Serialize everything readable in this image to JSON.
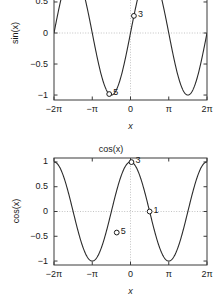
{
  "chart_data": [
    {
      "type": "line",
      "title": "",
      "title_visible": false,
      "xlabel": "x",
      "ylabel": "sin(x)",
      "xlim": [
        -6.283185307179586,
        6.283185307179586
      ],
      "ylim": [
        -1.08,
        1.08
      ],
      "y_view_clipped_top": true,
      "grid": false,
      "zero_gridlines": true,
      "legend": "none",
      "xticks": [
        -6.283185307179586,
        -3.141592653589793,
        0,
        3.141592653589793,
        6.283185307179586
      ],
      "xticklabels": [
        "−2π",
        "−π",
        "0",
        "π",
        "2π"
      ],
      "yticks": [
        1,
        0.5,
        0,
        -0.5,
        -1
      ],
      "yticklabels": [
        "1",
        "0.5",
        "0",
        "−0.5",
        "−1"
      ],
      "visible_yticklabels": [
        "0.5",
        "0",
        "−0.5",
        "−1"
      ],
      "series": [
        {
          "name": "sin(x)",
          "color": "#2b2b2b",
          "linewidth": 1.1,
          "x_start": -6.283185307179586,
          "x_end": 6.283185307179586,
          "samples": 400,
          "fn": "sin"
        }
      ],
      "markers": [
        {
          "label": "3",
          "x": 0.28,
          "y": 0.276
        },
        {
          "label": "5",
          "x": -1.75,
          "y": -0.984
        }
      ]
    },
    {
      "type": "line",
      "title": "cos(x)",
      "title_visible": true,
      "xlabel": "x",
      "ylabel": "cos(x)",
      "xlim": [
        -6.283185307179586,
        6.283185307179586
      ],
      "ylim": [
        -1.08,
        1.08
      ],
      "y_view_clipped_top": false,
      "grid": false,
      "zero_gridlines": true,
      "legend": "none",
      "xticks": [
        -6.283185307179586,
        -3.141592653589793,
        0,
        3.141592653589793,
        6.283185307179586
      ],
      "xticklabels": [
        "−2π",
        "−π",
        "0",
        "π",
        "2π"
      ],
      "yticks": [
        1,
        0.5,
        0,
        -0.5,
        -1
      ],
      "yticklabels": [
        "1",
        "0.5",
        "0",
        "−0.5",
        "−1"
      ],
      "visible_yticklabels": [
        "1",
        "0.5",
        "0",
        "−0.5",
        "−1"
      ],
      "series": [
        {
          "name": "cos(x)",
          "color": "#2b2b2b",
          "linewidth": 1.1,
          "x_start": -6.283185307179586,
          "x_end": 6.283185307179586,
          "samples": 400,
          "fn": "cos"
        }
      ],
      "markers": [
        {
          "label": "3",
          "x": 0.08,
          "y": 0.997
        },
        {
          "label": "1",
          "x": 1.57,
          "y": 0.0
        },
        {
          "label": "5",
          "x": -1.13,
          "y": -0.425
        }
      ]
    }
  ],
  "style": {
    "background": "#ffffff",
    "axis_color": "#3a3a3a",
    "curve_color": "#2b2b2b",
    "gridline_color": "#bdbdbd",
    "text_color": "#1a1a1a",
    "marker_edge_color": "#1a1a1a",
    "marker_face_color": "#ffffff"
  },
  "panels": [
    {
      "name": "sin-panel",
      "plot_left": 54,
      "plot_top": -34,
      "plot_width": 153,
      "plot_height": 134,
      "clip_top": 0
    },
    {
      "name": "cos-panel",
      "plot_left": 54,
      "plot_top": 158,
      "plot_width": 153,
      "plot_height": 107,
      "clip_top": 0
    }
  ]
}
